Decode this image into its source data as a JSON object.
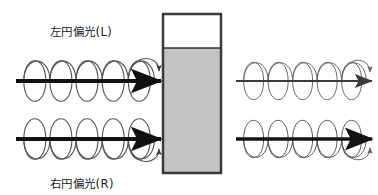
{
  "figure": {
    "title_top": "左円偏光(L)",
    "title_bottom": "右円偏光(R)",
    "background_color": "#ffffff"
  },
  "labels": {
    "top": {
      "text": "左円偏光(L)",
      "x": 50,
      "y": 36
    },
    "bottom": {
      "text": "右円偏光(R)",
      "x": 50,
      "y": 188
    }
  },
  "sample_cell": {
    "name": "sample-cuvette",
    "x": 163,
    "y": 14,
    "width": 58,
    "height": 159,
    "border_color": "#3a3a3a",
    "border_width": 2.5,
    "empty_fill": "#ffffff",
    "solution_fill": "#c4c4c4",
    "solution_top_y": 48,
    "solution_divider_color": "#2f2f2f"
  },
  "beams": [
    {
      "id": "incident-left-circular",
      "handedness": "L",
      "side": "incident",
      "position": "top",
      "axis_y": 81,
      "x_start": 16,
      "x_end": 161,
      "loops": 5,
      "loop_rx": 11,
      "loop_ry": 24,
      "axis_color": "#111111",
      "axis_width": 4.2,
      "coil_color": "#555555",
      "coil_width": 1.1,
      "curl_arrow_position": "top",
      "curl_direction": "clockwise"
    },
    {
      "id": "incident-right-circular",
      "handedness": "R",
      "side": "incident",
      "position": "bottom",
      "axis_y": 139,
      "x_start": 16,
      "x_end": 161,
      "loops": 5,
      "loop_rx": 11,
      "loop_ry": 24,
      "axis_color": "#111111",
      "axis_width": 4.2,
      "coil_color": "#555555",
      "coil_width": 1.1,
      "curl_arrow_position": "bottom",
      "curl_direction": "counterclockwise"
    },
    {
      "id": "transmitted-left-circular",
      "handedness": "L",
      "side": "transmitted",
      "position": "top",
      "axis_y": 81,
      "x_start": 236,
      "x_end": 372,
      "loops": 5,
      "loop_rx": 10,
      "loop_ry": 22,
      "axis_color": "#3b3b3b",
      "axis_width": 2.1,
      "coil_color": "#6a6a6a",
      "coil_width": 1.0,
      "curl_arrow_position": "top",
      "curl_direction": "clockwise"
    },
    {
      "id": "transmitted-right-circular",
      "handedness": "R",
      "side": "transmitted",
      "position": "bottom",
      "axis_y": 139,
      "x_start": 236,
      "x_end": 372,
      "loops": 5,
      "loop_rx": 10,
      "loop_ry": 22,
      "axis_color": "#141414",
      "axis_width": 3.6,
      "coil_color": "#5c5c5c",
      "coil_width": 1.0,
      "curl_arrow_position": "bottom",
      "curl_direction": "counterclockwise"
    }
  ],
  "colors": {
    "ink": "#111111",
    "mid_gray": "#555555",
    "solution_gray": "#c4c4c4",
    "cell_border": "#3a3a3a"
  }
}
